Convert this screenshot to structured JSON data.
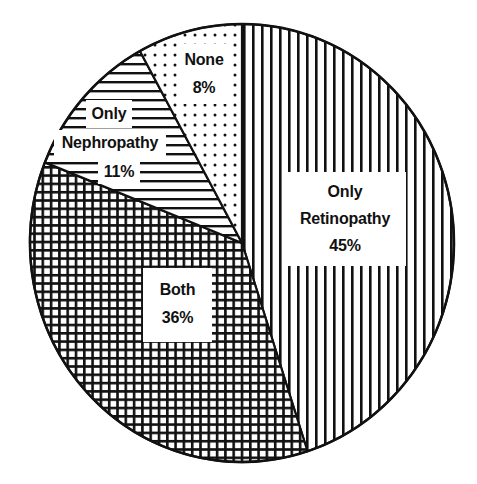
{
  "chart_data": {
    "type": "pie",
    "title": "",
    "start_angle_deg": 0,
    "direction": "clockwise",
    "center": [
      242,
      243
    ],
    "radius": [
      212,
      219
    ],
    "slices": [
      {
        "label_lines": [
          "Only",
          "Retinopathy"
        ],
        "label": "Only Retinopathy",
        "value": 45,
        "value_text": "45%",
        "pattern": "vertical-stripes"
      },
      {
        "label_lines": [
          "Both"
        ],
        "label": "Both",
        "value": 36,
        "value_text": "36%",
        "pattern": "grid"
      },
      {
        "label_lines": [
          "Only",
          "Nephropathy"
        ],
        "label": "Only Nephropathy",
        "value": 11,
        "value_text": "11%",
        "pattern": "horizontal-stripes"
      },
      {
        "label_lines": [
          "None"
        ],
        "label": "None",
        "value": 8,
        "value_text": "8%",
        "pattern": "dots"
      }
    ],
    "legend": "none (labels inside slices)",
    "colors": {
      "ink": "#111111",
      "background": "#ffffff"
    }
  },
  "labels": {
    "retinopathy": {
      "line1": "Only",
      "line2": "Retinopathy",
      "value": "45%"
    },
    "both": {
      "line1": "Both",
      "value": "36%"
    },
    "nephropathy": {
      "line1": "Only",
      "line2": "Nephropathy",
      "value": "11%"
    },
    "none": {
      "line1": "None",
      "value": "8%"
    }
  }
}
